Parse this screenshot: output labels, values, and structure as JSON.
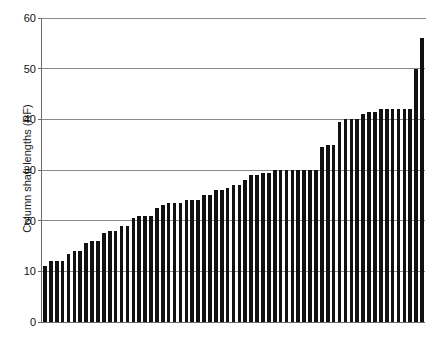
{
  "chart_data": {
    "type": "bar",
    "title": "",
    "xlabel": "",
    "ylabel": "Column shaft lengths (RF)",
    "ylim": [
      0,
      60
    ],
    "yticks": [
      0,
      10,
      20,
      30,
      40,
      50,
      60
    ],
    "ytick_labels": [
      "0",
      "10",
      "20",
      "30",
      "40",
      "50",
      "60"
    ],
    "grid": true,
    "legend": "none",
    "bar_color": "#111111",
    "axis_color": "#6b6b6b",
    "grid_color": "#8a8a8a",
    "categories": [
      "1",
      "2",
      "3",
      "4",
      "5",
      "6",
      "7",
      "8",
      "9",
      "10",
      "11",
      "12",
      "13",
      "14",
      "15",
      "16",
      "17",
      "18",
      "19",
      "20",
      "21",
      "22",
      "23",
      "24",
      "25",
      "26",
      "27",
      "28",
      "29",
      "30",
      "31",
      "32",
      "33",
      "34",
      "35",
      "36",
      "37",
      "38",
      "39",
      "40",
      "41",
      "42",
      "43",
      "44",
      "45",
      "46",
      "47",
      "48",
      "49",
      "50",
      "51",
      "52",
      "53",
      "54",
      "55",
      "56",
      "57",
      "58",
      "59",
      "60",
      "61",
      "62",
      "63",
      "64",
      "65"
    ],
    "values": [
      11,
      12,
      12,
      12,
      13.5,
      14,
      14,
      15.5,
      16,
      16,
      17.5,
      18,
      18,
      19,
      19,
      20.5,
      21,
      21,
      21,
      22.5,
      23,
      23.5,
      23.5,
      23.5,
      24,
      24,
      24,
      25,
      25,
      26,
      26,
      26.5,
      27,
      27,
      28,
      29,
      29,
      29.5,
      29.5,
      30,
      30,
      30,
      30,
      30,
      30,
      30,
      30,
      34.5,
      35,
      35,
      39.5,
      40,
      40,
      40,
      41,
      41.5,
      41.5,
      42,
      42,
      42,
      42,
      42,
      42,
      50,
      56
    ]
  }
}
